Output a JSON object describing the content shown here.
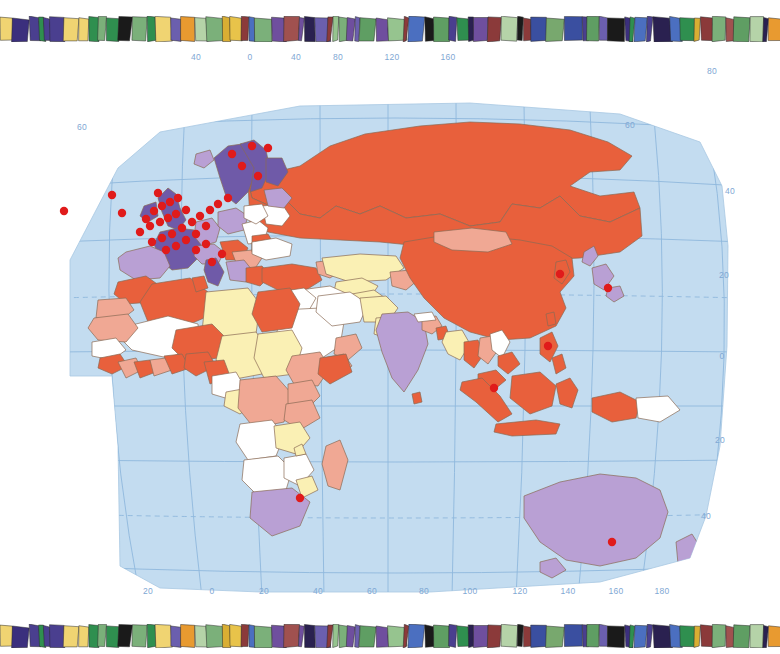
{
  "page": {
    "background_color": "#ffffff"
  },
  "decor": {
    "top_band": {
      "name": "mosaic-band",
      "description": "stained-glass mosaic strip",
      "tile_colors": [
        "#4a3f8f",
        "#3b2f7d",
        "#6b5fae",
        "#2a2150",
        "#1a1a1a",
        "#e8c34a",
        "#f0d472",
        "#d9ae33",
        "#c9a02b",
        "#7bb07a",
        "#96c48f",
        "#5f9e63",
        "#2f8f4f",
        "#3a4fa0",
        "#8b3a3a",
        "#a0514f",
        "#6f4f9e",
        "#4b6fc0",
        "#78a86e",
        "#b5d3a8",
        "#e89a30"
      ]
    },
    "bottom_band": {
      "name": "mosaic-band",
      "description": "stained-glass mosaic strip",
      "tile_colors": [
        "#4a3f8f",
        "#3b2f7d",
        "#6b5fae",
        "#2a2150",
        "#1a1a1a",
        "#e8c34a",
        "#f0d472",
        "#d9ae33",
        "#c9a02b",
        "#7bb07a",
        "#96c48f",
        "#5f9e63",
        "#2f8f4f",
        "#3a4fa0",
        "#8b3a3a",
        "#a0514f",
        "#6f4f9e",
        "#4b6fc0",
        "#78a86e",
        "#b5d3a8",
        "#e89a30"
      ]
    }
  },
  "map": {
    "projection": "globe / orthographic-style world map (Eastern Hemisphere)",
    "ocean_color": "#c3dcf0",
    "graticule_color": "#8fb8dc",
    "border_color": "#8a6a55",
    "marker_color": "#e01b1b",
    "marker_label": "site-marker",
    "legend_colors": {
      "orange_red": "#e8603c",
      "salmon": "#f0a894",
      "pale_yellow": "#faf0b4",
      "white": "#ffffff",
      "lavender": "#b9a0d4",
      "deep_purple": "#6f5aa8"
    },
    "axes": {
      "top_labels": [
        "40",
        "0",
        "40",
        "80",
        "120",
        "160"
      ],
      "bottom_labels": [
        "20",
        "0",
        "20",
        "40",
        "60",
        "80",
        "100",
        "120",
        "140",
        "160",
        "180"
      ],
      "left_labels": [
        "60"
      ],
      "right_labels": [
        "80",
        "60",
        "40",
        "20",
        "0",
        "20",
        "40"
      ]
    }
  }
}
